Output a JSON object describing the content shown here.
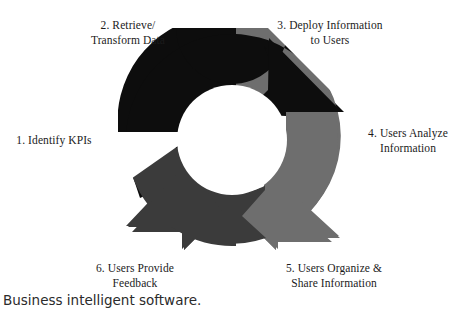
{
  "figure": {
    "caption": "Business intelligent software.",
    "diagram_title": "Business Intelligence Cycle",
    "type": "cycle-diagram",
    "step_count": 6,
    "colors": {
      "segment_black": "#0d0d0d",
      "segment_dark_gray": "#3b3b3b",
      "segment_mid_gray": "#6e6e6e",
      "background": "#ffffff",
      "text": "#1b1b1b"
    },
    "steps": [
      {
        "number": "1",
        "label": "1. Identify KPIs",
        "position": "left"
      },
      {
        "number": "2",
        "label": "2. Retrieve/\nTransform Data",
        "position": "top-left"
      },
      {
        "number": "3",
        "label": "3. Deploy Information\nto Users",
        "position": "top-right"
      },
      {
        "number": "4",
        "label": "4. Users Analyze\nInformation",
        "position": "right"
      },
      {
        "number": "5",
        "label": "5. Users Organize &\nShare Information",
        "position": "bottom-right"
      },
      {
        "number": "6",
        "label": "6. Users Provide\nFeedback",
        "position": "bottom-left"
      }
    ]
  }
}
